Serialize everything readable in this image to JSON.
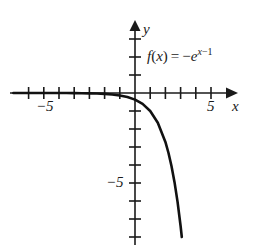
{
  "figure": {
    "kind": "cartesian-plot",
    "equation": {
      "function_name": "f",
      "argument": "x",
      "equals": "=",
      "sign": "−",
      "base": "e",
      "exponent_var": "x",
      "exponent_op": "−",
      "exponent_const": "1",
      "plain": "f(x) = −e^(x−1)"
    },
    "axes": {
      "x_label": "x",
      "y_label": "y",
      "x_tick_labels": [
        "−5",
        "5"
      ],
      "y_tick_labels": [
        "−5"
      ],
      "x_range": [
        -8,
        6
      ],
      "y_range": [
        -8,
        4
      ],
      "x_ticks": [
        -7,
        -6,
        -5,
        -4,
        -3,
        -2,
        -1,
        1,
        2,
        3,
        4,
        5
      ],
      "y_ticks": [
        -8,
        -7,
        -6,
        -5,
        -4,
        -3,
        -2,
        -1,
        1,
        2,
        3
      ],
      "grid": false,
      "axis_color": "#1a1a1a",
      "curve_color": "#111111"
    }
  },
  "chart_data": {
    "type": "line",
    "title": "",
    "xlabel": "x",
    "ylabel": "y",
    "xlim": [
      -8,
      6
    ],
    "ylim": [
      -8,
      4
    ],
    "grid": false,
    "legend": "none",
    "annotations": [
      {
        "text": "f(x) = −e^(x−1)",
        "x": 1.0,
        "y": 2.5
      }
    ],
    "series": [
      {
        "name": "f(x) = -e^(x-1)",
        "expression": "-exp(x-1)",
        "color": "#111111",
        "x": [
          -8.0,
          -7.5,
          -7.0,
          -6.5,
          -6.0,
          -5.5,
          -5.0,
          -4.5,
          -4.0,
          -3.5,
          -3.0,
          -2.5,
          -2.0,
          -1.5,
          -1.0,
          -0.5,
          0.0,
          0.5,
          1.0,
          1.5,
          2.0,
          2.2,
          2.4,
          2.6,
          2.8,
          3.0,
          3.1
        ],
        "y": [
          -0.0001,
          -0.0002,
          -0.0003,
          -0.0006,
          -0.0009,
          -0.0015,
          -0.0025,
          -0.0041,
          -0.0067,
          -0.0111,
          -0.0183,
          -0.0302,
          -0.0498,
          -0.0821,
          -0.1353,
          -0.2231,
          -0.3679,
          -0.6065,
          -1.0,
          -1.6487,
          -2.7183,
          -3.3201,
          -4.0552,
          -4.953,
          -6.0496,
          -7.3891,
          -8.1662
        ]
      }
    ]
  }
}
